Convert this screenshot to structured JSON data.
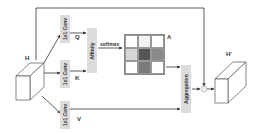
{
  "diagram": {
    "input_label": "H",
    "output_label": "H'",
    "conv_q_label": "1x1 Conv",
    "conv_k_label": "1x1 Conv",
    "conv_v_label": "1x1 Conv",
    "q_label": "Q",
    "k_label": "K",
    "v_label": "V",
    "affinity_label": "Affinity",
    "softmax_label": "softmax",
    "attention_label": "A",
    "aggregation_label": "Aggregation",
    "attention_grid": [
      [
        "#ffffff",
        "#f2f2f2",
        "#ffffff"
      ],
      [
        "#d6d6d6",
        "#555555",
        "#8a8a8a"
      ],
      [
        "#ffffff",
        "#7a7a7a",
        "#ffffff"
      ]
    ],
    "box_fill": "#dcdcdc",
    "line_color": "#333333"
  }
}
